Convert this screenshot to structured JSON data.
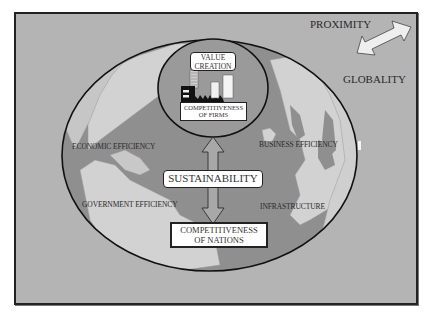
{
  "diagram": {
    "corner": {
      "top_label": "PROXIMITY",
      "bottom_label": "GLOBALITY",
      "arrow_icon": "double-headed-arrow"
    },
    "inner_circle": {
      "value_creation": "VALUE\nCREATION",
      "value_creation_line1": "VALUE",
      "value_creation_line2": "CREATION",
      "firms_line1": "COMPETITIVENESS",
      "firms_line2": "OF FIRMS",
      "icon": "factory-icon"
    },
    "globe_factors": {
      "economic_efficiency": "ECONOMIC EFFICIENCY",
      "business_efficiency": "BUSINESS EFFICIENCY",
      "government_efficiency": "GOVERNMENT EFFICIENCY",
      "infrastructure": "INFRASTRUCTURE"
    },
    "center": {
      "sustainability": "SUSTAINABILITY",
      "nations_line1": "COMPETITIVENESS",
      "nations_line2": "OF NATIONS"
    },
    "colors": {
      "background": "#b4b4b4",
      "ocean": "#8f8f8f",
      "land": "#d2d2d2",
      "outline": "#111111",
      "box_fill": "#ffffff"
    }
  }
}
